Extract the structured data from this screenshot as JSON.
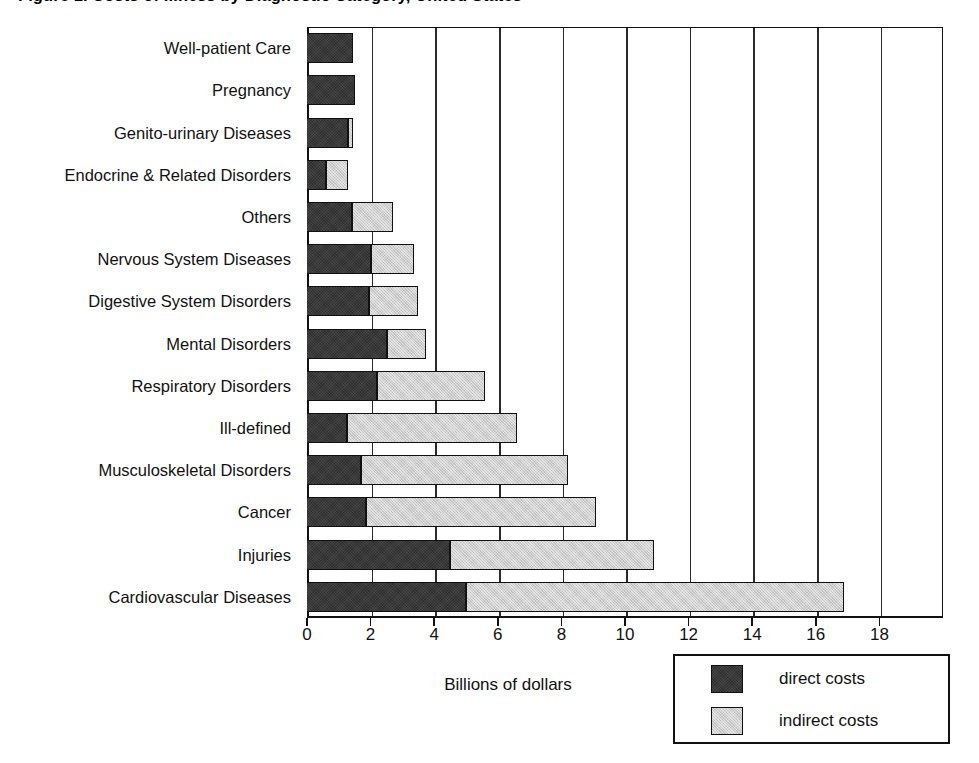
{
  "chart_data": {
    "type": "bar",
    "orientation": "horizontal",
    "stacked": true,
    "title": "Figure 1. Costs of Illness by Diagnostic Category, United States",
    "xlabel": "Billions of dollars",
    "ylabel": "",
    "xlim": [
      0,
      20
    ],
    "xticks": [
      0,
      2,
      4,
      6,
      8,
      10,
      12,
      14,
      16,
      18
    ],
    "xticklabels": [
      "0",
      "2",
      "4",
      "6",
      "8",
      "10",
      "12",
      "14",
      "16",
      "18"
    ],
    "grid": "vertical",
    "legend_position": "bottom-right",
    "categories": [
      "Well-patient Care",
      "Pregnancy",
      "Genito-urinary Diseases",
      "Endocrine & Related Disorders",
      "Others",
      "Nervous System Diseases",
      "Digestive System Disorders",
      "Mental Disorders",
      "Respiratory Disorders",
      "Ill-defined",
      "Musculoskeletal Disorders",
      "Cancer",
      "Injuries",
      "Cardiovascular Diseases"
    ],
    "series": [
      {
        "name": "direct costs",
        "color": "#3a3a3a",
        "values": [
          1.45,
          1.5,
          1.3,
          0.6,
          1.4,
          2.0,
          1.95,
          2.5,
          2.2,
          1.25,
          1.7,
          1.85,
          4.5,
          5.0
        ]
      },
      {
        "name": "indirect costs",
        "color": "#cfcfcf",
        "values": [
          0.0,
          0.0,
          0.15,
          0.7,
          1.3,
          1.35,
          1.55,
          1.25,
          3.4,
          5.35,
          6.5,
          7.25,
          6.4,
          11.9
        ]
      }
    ],
    "totals": [
      1.45,
      1.5,
      1.45,
      1.3,
      2.7,
      3.35,
      3.5,
      3.75,
      5.6,
      6.6,
      8.2,
      9.1,
      10.9,
      16.9
    ]
  },
  "legend": {
    "entries": [
      {
        "label": "direct costs",
        "swatch": "#3a3a3a"
      },
      {
        "label": "indirect costs",
        "swatch": "#cfcfcf"
      }
    ]
  }
}
